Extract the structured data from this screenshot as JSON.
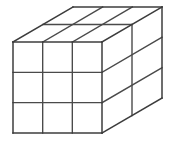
{
  "figure": {
    "type": "line-drawing",
    "projection": "oblique"
  },
  "canvas": {
    "width": 172,
    "height": 144,
    "background_color": "#ffffff"
  },
  "style": {
    "edge_color": "#3c3c3c",
    "grid_color": "#4a4a4a",
    "face_color": "#ffffff",
    "edge_width": 1.5,
    "grid_width": 1.4
  },
  "solid": {
    "columns_x": 3,
    "rows_y": 3,
    "layers_z": 2,
    "total_unit_cubes": 18,
    "visible_faces": [
      "front",
      "right",
      "top"
    ]
  },
  "geometry": {
    "front_top_left": {
      "x": 13,
      "y": 42
    },
    "front_top_right": {
      "x": 102,
      "y": 42
    },
    "front_bottom_left": {
      "x": 13,
      "y": 133
    },
    "front_bottom_right": {
      "x": 102,
      "y": 133
    },
    "depth_offset": {
      "dx": 60,
      "dy": -35
    },
    "back_top_left": {
      "x": 73,
      "y": 7
    },
    "back_top_right": {
      "x": 162,
      "y": 7
    },
    "back_bottom_right": {
      "x": 162,
      "y": 98
    },
    "front_face_width": 89,
    "front_face_height": 91,
    "cell_width": 29.67,
    "cell_height": 30.33
  },
  "faces": {
    "front": {
      "label": "front-face",
      "grid_cols": 3,
      "grid_rows": 3,
      "cell_count": 9
    },
    "right": {
      "label": "right-face",
      "grid_cols": 2,
      "grid_rows": 3,
      "cell_count": 6
    },
    "top": {
      "label": "top-face",
      "grid_cols": 3,
      "grid_rows": 2,
      "cell_count": 6
    }
  }
}
